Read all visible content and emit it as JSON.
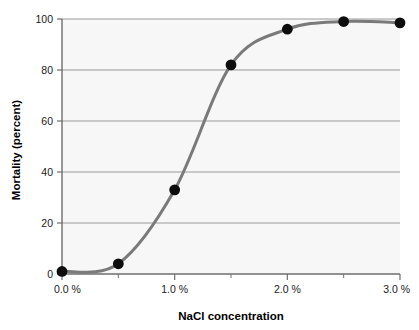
{
  "chart_data": {
    "type": "line",
    "title": "",
    "xlabel": "NaCl concentration",
    "ylabel": "Mortality (percent)",
    "xlim": [
      0.0,
      3.0
    ],
    "ylim": [
      0,
      100
    ],
    "grid": true,
    "legend": false,
    "marker": "filled-circle",
    "x": [
      0.0,
      0.5,
      1.0,
      1.5,
      2.0,
      2.5,
      3.0
    ],
    "values": [
      1,
      4,
      33,
      82,
      96,
      99,
      98.5
    ],
    "x_tick_labels": [
      "0.0 %",
      "1.0 %",
      "2.0 %",
      "3.0 %"
    ],
    "x_tick_values": [
      0.0,
      1.0,
      2.0,
      3.0
    ],
    "x_minor_tick_values": [
      0.5,
      1.5,
      2.5
    ],
    "y_tick_labels": [
      "0",
      "20",
      "40",
      "60",
      "80",
      "100"
    ],
    "y_tick_values": [
      0,
      20,
      40,
      60,
      80,
      100
    ],
    "series": [
      {
        "name": "Mortality",
        "x": [
          0.0,
          0.5,
          1.0,
          1.5,
          2.0,
          2.5,
          3.0
        ],
        "values": [
          1,
          4,
          33,
          82,
          96,
          99,
          98.5
        ]
      }
    ],
    "colors": {
      "curve": "#7a7a7a",
      "marker": "#0d0d0d",
      "gridline": "#999999",
      "axis": "#6e6e6e",
      "plot_background": "#f7f7f7",
      "figure_background": "#ffffff",
      "text": "#1a1a1a"
    }
  }
}
